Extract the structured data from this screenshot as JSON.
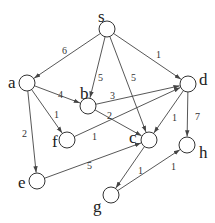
{
  "graph": {
    "type": "directed-weighted",
    "node_radius": 8,
    "colors": {
      "stroke": "#333333",
      "fill": "#ffffff",
      "text": "#222222"
    },
    "nodes": [
      {
        "id": "s",
        "label": "s",
        "x": 107,
        "y": 29,
        "lx": 98,
        "ly": 22
      },
      {
        "id": "a",
        "label": "a",
        "x": 27,
        "y": 83,
        "lx": 8,
        "ly": 88
      },
      {
        "id": "b",
        "label": "b",
        "x": 88,
        "y": 106,
        "lx": 80,
        "ly": 99
      },
      {
        "id": "d",
        "label": "d",
        "x": 188,
        "y": 84,
        "lx": 199,
        "ly": 85
      },
      {
        "id": "f",
        "label": "f",
        "x": 67,
        "y": 140,
        "lx": 52,
        "ly": 147
      },
      {
        "id": "c",
        "label": "c",
        "x": 149,
        "y": 140,
        "lx": 129,
        "ly": 143
      },
      {
        "id": "h",
        "label": "h",
        "x": 187,
        "y": 145,
        "lx": 199,
        "ly": 158
      },
      {
        "id": "e",
        "label": "e",
        "x": 37,
        "y": 181,
        "lx": 18,
        "ly": 188
      },
      {
        "id": "g",
        "label": "g",
        "x": 111,
        "y": 195,
        "lx": 93,
        "ly": 212
      }
    ],
    "edges": [
      {
        "from": "s",
        "to": "a",
        "weight": "6",
        "lx": 62,
        "ly": 54
      },
      {
        "from": "s",
        "to": "b",
        "weight": "5",
        "lx": 98,
        "ly": 81
      },
      {
        "from": "s",
        "to": "c",
        "weight": "5",
        "lx": 131,
        "ly": 81
      },
      {
        "from": "s",
        "to": "d",
        "weight": "1",
        "lx": 156,
        "ly": 58
      },
      {
        "from": "a",
        "to": "b",
        "weight": "4",
        "lx": 58,
        "ly": 98
      },
      {
        "from": "a",
        "to": "f",
        "weight": "1",
        "lx": 54,
        "ly": 118
      },
      {
        "from": "a",
        "to": "e",
        "weight": "2",
        "lx": 22,
        "ly": 137
      },
      {
        "from": "b",
        "to": "d",
        "weight": "3",
        "lx": 110,
        "ly": 99
      },
      {
        "from": "b",
        "to": "c",
        "weight": "2",
        "lx": 107,
        "ly": 119
      },
      {
        "from": "f",
        "to": "d",
        "weight": "1",
        "lx": 92,
        "ly": 140
      },
      {
        "from": "d",
        "to": "c",
        "weight": "1",
        "lx": 172,
        "ly": 121
      },
      {
        "from": "d",
        "to": "h",
        "weight": "7",
        "lx": 195,
        "ly": 120
      },
      {
        "from": "e",
        "to": "c",
        "weight": "5",
        "lx": 87,
        "ly": 169
      },
      {
        "from": "c",
        "to": "g",
        "weight": "1",
        "lx": 138,
        "ly": 174
      },
      {
        "from": "g",
        "to": "h",
        "weight": "1",
        "lx": 171,
        "ly": 170
      }
    ]
  }
}
